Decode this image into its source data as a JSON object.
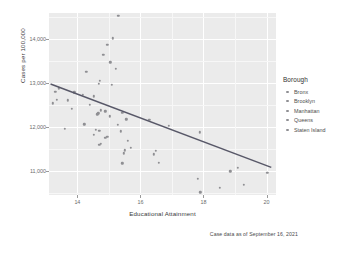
{
  "chart_data": {
    "type": "scatter",
    "title": "",
    "subtitle": "",
    "xlabel": "Educational Attainment",
    "ylabel": "Cases per 100,000",
    "caption": "Case data as of September 16, 2021",
    "xlim": [
      13.1,
      20.3
    ],
    "ylim": [
      10450,
      14600
    ],
    "xticks": [
      14,
      16,
      18,
      20
    ],
    "xticklabels": [
      "14",
      "16",
      "18",
      "20"
    ],
    "yticks": [
      11000,
      12000,
      13000,
      14000
    ],
    "yticklabels": [
      "11,000",
      "12,000",
      "13,000",
      "14,000"
    ],
    "grid": true,
    "grid_minor": true,
    "panel_background": "#ebebeb",
    "grid_color": "#ffffff",
    "point_color": "#8f8f93",
    "trend_color": "#585868",
    "legend": {
      "title": "Borough",
      "position": "right",
      "entries": [
        {
          "label": "Bronx",
          "color": "#8f8f93"
        },
        {
          "label": "Brooklyn",
          "color": "#8f8f93"
        },
        {
          "label": "Manhattan",
          "color": "#8f8f93"
        },
        {
          "label": "Queens",
          "color": "#8f8f93"
        },
        {
          "label": "Staten Island",
          "color": "#8f8f93"
        }
      ]
    },
    "trendline": {
      "type": "linear",
      "x": [
        13.15,
        20.15
      ],
      "y": [
        12980,
        11080
      ]
    },
    "points": [
      {
        "x": 15.3,
        "y": 14540
      },
      {
        "x": 15.12,
        "y": 14020
      },
      {
        "x": 14.95,
        "y": 13870
      },
      {
        "x": 14.82,
        "y": 13640
      },
      {
        "x": 15.05,
        "y": 13480
      },
      {
        "x": 15.22,
        "y": 13330
      },
      {
        "x": 14.28,
        "y": 13260
      },
      {
        "x": 14.72,
        "y": 13060
      },
      {
        "x": 14.68,
        "y": 12990
      },
      {
        "x": 15.1,
        "y": 12960
      },
      {
        "x": 13.42,
        "y": 12880
      },
      {
        "x": 13.3,
        "y": 12810
      },
      {
        "x": 13.9,
        "y": 12790
      },
      {
        "x": 14.18,
        "y": 12740
      },
      {
        "x": 14.52,
        "y": 12700
      },
      {
        "x": 13.35,
        "y": 12620
      },
      {
        "x": 13.7,
        "y": 12610
      },
      {
        "x": 13.22,
        "y": 12540
      },
      {
        "x": 14.4,
        "y": 12500
      },
      {
        "x": 13.82,
        "y": 12420
      },
      {
        "x": 14.75,
        "y": 12380
      },
      {
        "x": 14.88,
        "y": 12360
      },
      {
        "x": 15.42,
        "y": 12330
      },
      {
        "x": 14.66,
        "y": 12310
      },
      {
        "x": 14.63,
        "y": 12290
      },
      {
        "x": 15.02,
        "y": 12240
      },
      {
        "x": 15.55,
        "y": 12180
      },
      {
        "x": 16.28,
        "y": 12160
      },
      {
        "x": 14.22,
        "y": 12060
      },
      {
        "x": 15.28,
        "y": 12050
      },
      {
        "x": 16.9,
        "y": 12030
      },
      {
        "x": 13.6,
        "y": 11960
      },
      {
        "x": 14.58,
        "y": 11940
      },
      {
        "x": 14.7,
        "y": 11920
      },
      {
        "x": 15.38,
        "y": 11900
      },
      {
        "x": 17.88,
        "y": 11880
      },
      {
        "x": 14.52,
        "y": 11820
      },
      {
        "x": 14.95,
        "y": 11780
      },
      {
        "x": 14.88,
        "y": 11760
      },
      {
        "x": 15.6,
        "y": 11680
      },
      {
        "x": 14.74,
        "y": 11620
      },
      {
        "x": 14.7,
        "y": 11600
      },
      {
        "x": 15.7,
        "y": 11520
      },
      {
        "x": 15.5,
        "y": 11470
      },
      {
        "x": 16.48,
        "y": 11460
      },
      {
        "x": 15.48,
        "y": 11400
      },
      {
        "x": 16.42,
        "y": 11380
      },
      {
        "x": 16.58,
        "y": 11190
      },
      {
        "x": 15.42,
        "y": 11170
      },
      {
        "x": 19.08,
        "y": 11070
      },
      {
        "x": 18.85,
        "y": 10990
      },
      {
        "x": 20.02,
        "y": 10960
      },
      {
        "x": 17.82,
        "y": 10820
      },
      {
        "x": 19.28,
        "y": 10680
      },
      {
        "x": 18.52,
        "y": 10620
      },
      {
        "x": 17.9,
        "y": 10510
      }
    ]
  },
  "bleed_text": ""
}
